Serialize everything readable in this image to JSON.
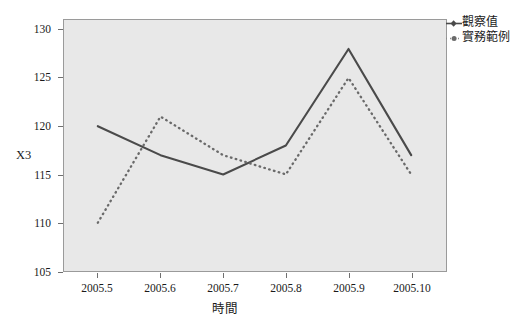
{
  "chart_data": {
    "type": "line",
    "title": "",
    "xlabel": "時間",
    "ylabel": "X3",
    "x": [
      "2005.5",
      "2005.6",
      "2005.7",
      "2005.8",
      "2005.9",
      "2005.10"
    ],
    "categories": [
      "2005.5",
      "2005.6",
      "2005.7",
      "2005.8",
      "2005.9",
      "2005.10"
    ],
    "series": [
      {
        "name": "觀察值",
        "style": "solid",
        "color": "#4a4a4a",
        "values": [
          120,
          117,
          115,
          118,
          128,
          117
        ]
      },
      {
        "name": "實務範例",
        "style": "dotted",
        "color": "#6a6a6a",
        "values": [
          110,
          121,
          117,
          115,
          125,
          115
        ]
      }
    ],
    "ylim": [
      105,
      131
    ],
    "yticks": [
      105,
      110,
      115,
      120,
      125,
      130
    ],
    "ytick_labels": [
      "105",
      "110",
      "115",
      "120",
      "125",
      "130"
    ],
    "xtick_labels": [
      "2005.5",
      "2005.6",
      "2005.7",
      "2005.8",
      "2005.9",
      "2005.10"
    ],
    "grid": false,
    "legend_position": "outside-right-top",
    "plot_background": "#e8e8e8",
    "frame_color": "#9a9a9a"
  },
  "legend": {
    "entries": [
      {
        "label": "觀察值",
        "marker": "solid-line-diamond-icon"
      },
      {
        "label": "實務範例",
        "marker": "dotted-line-dot-icon"
      }
    ]
  },
  "axes": {
    "y_title": "X3",
    "x_title": "時間",
    "y_labels": [
      "130",
      "125",
      "120",
      "115",
      "110",
      "105"
    ],
    "x_labels": [
      "2005.5",
      "2005.6",
      "2005.7",
      "2005.8",
      "2005.9",
      "2005.10"
    ]
  }
}
